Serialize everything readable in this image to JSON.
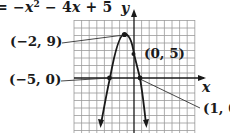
{
  "equation": {
    "prefix": "= −",
    "var1": "x",
    "exp": "2",
    "middle": " − 4",
    "var2": "x",
    "suffix": " + 5"
  },
  "axes": {
    "x_label": "x",
    "y_label": "y"
  },
  "points": [
    {
      "label": "(−2, 9)",
      "x": -2,
      "y": 9,
      "role": "vertex"
    },
    {
      "label": "(0, 5)",
      "x": 0,
      "y": 5,
      "role": "y-intercept"
    },
    {
      "label": "(−5, 0)",
      "x": -5,
      "y": 0,
      "role": "x-intercept"
    },
    {
      "label": "(1, 0)",
      "x": 1,
      "y": 0,
      "role": "x-intercept"
    }
  ],
  "colors": {
    "ink": "#1a1a1a",
    "grid": "#9a9a9a"
  }
}
